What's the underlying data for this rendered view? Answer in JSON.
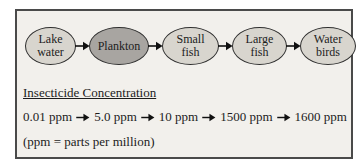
{
  "flow": {
    "stages": [
      {
        "name": "lake-water",
        "lines": [
          "Lake",
          "water"
        ],
        "variant": "light"
      },
      {
        "name": "plankton",
        "lines": [
          "Plankton"
        ],
        "variant": "dark"
      },
      {
        "name": "small-fish",
        "lines": [
          "Small",
          "fish"
        ],
        "variant": "light"
      },
      {
        "name": "large-fish",
        "lines": [
          "Large",
          "fish"
        ],
        "variant": "light"
      },
      {
        "name": "water-birds",
        "lines": [
          "Water",
          "birds"
        ],
        "variant": "light"
      }
    ]
  },
  "concentration": {
    "heading": "Insecticide Concentration",
    "values": [
      "0.01 ppm",
      "5.0 ppm",
      "10 ppm",
      "1500 ppm",
      "1600 ppm"
    ],
    "footnote": "(ppm = parts per million)"
  },
  "colors": {
    "panel_background": "#f2f0ec",
    "panel_border": "#4a4a4a",
    "stage_fill_light": "#d8d5ce",
    "stage_fill_dark": "#a8a5a1",
    "stage_border": "#2e2e2e",
    "arrow": "#111111"
  }
}
